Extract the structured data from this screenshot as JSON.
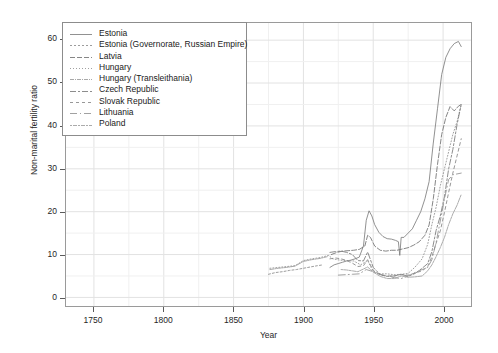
{
  "chart_data": {
    "type": "line",
    "title": "",
    "xlabel": "Year",
    "ylabel": "Non-marital fertility ratio",
    "xlim": [
      1730,
      2020
    ],
    "ylim": [
      -2,
      64
    ],
    "xticks": [
      1750,
      1800,
      1850,
      1900,
      1950,
      2000
    ],
    "yticks": [
      0,
      10,
      20,
      30,
      40,
      50,
      60
    ],
    "grid": true,
    "legend_position": "top-left",
    "series": [
      {
        "name": "Estonia",
        "color": "#7d7d7d",
        "dash": "none",
        "points": [
          [
            1919,
            7.0
          ],
          [
            1922,
            7.6
          ],
          [
            1925,
            7.9
          ],
          [
            1928,
            8.2
          ],
          [
            1931,
            8.5
          ],
          [
            1934,
            8.7
          ],
          [
            1937,
            9.0
          ],
          [
            1940,
            9.4
          ],
          [
            1943,
            12.0
          ],
          [
            1945,
            18.0
          ],
          [
            1947,
            20.2
          ],
          [
            1949,
            19.0
          ],
          [
            1951,
            17.0
          ],
          [
            1954,
            15.2
          ],
          [
            1957,
            14.2
          ],
          [
            1960,
            13.7
          ],
          [
            1963,
            13.6
          ],
          [
            1966,
            13.3
          ],
          [
            1968,
            13.0
          ],
          [
            1969,
            9.8
          ],
          [
            1970,
            14.0
          ],
          [
            1972,
            14.0
          ],
          [
            1975,
            15.0
          ],
          [
            1978,
            16.0
          ],
          [
            1981,
            18.0
          ],
          [
            1984,
            20.0
          ],
          [
            1987,
            23.0
          ],
          [
            1990,
            27.0
          ],
          [
            1993,
            36.0
          ],
          [
            1996,
            44.0
          ],
          [
            1999,
            52.0
          ],
          [
            2002,
            56.0
          ],
          [
            2005,
            58.0
          ],
          [
            2008,
            59.2
          ],
          [
            2011,
            59.7
          ],
          [
            2013,
            58.5
          ]
        ]
      },
      {
        "name": "Estonia (Governorate, Russian Empire)",
        "color": "#8a8a8a",
        "dash": "2,2",
        "points": [
          [
            1875,
            5.4
          ],
          [
            1880,
            5.8
          ],
          [
            1885,
            6.0
          ],
          [
            1890,
            6.3
          ],
          [
            1895,
            6.5
          ],
          [
            1900,
            6.8
          ],
          [
            1905,
            7.1
          ],
          [
            1910,
            7.4
          ],
          [
            1914,
            7.6
          ]
        ]
      },
      {
        "name": "Latvia",
        "color": "#707070",
        "dash": "5,2",
        "points": [
          [
            1920,
            10.0
          ],
          [
            1924,
            10.5
          ],
          [
            1928,
            10.8
          ],
          [
            1932,
            10.9
          ],
          [
            1936,
            11.0
          ],
          [
            1940,
            11.2
          ],
          [
            1944,
            12.0
          ],
          [
            1946,
            14.5
          ],
          [
            1948,
            14.0
          ],
          [
            1951,
            12.0
          ],
          [
            1955,
            11.0
          ],
          [
            1959,
            10.8
          ],
          [
            1963,
            11.0
          ],
          [
            1967,
            11.0
          ],
          [
            1971,
            11.3
          ],
          [
            1975,
            11.6
          ],
          [
            1979,
            12.2
          ],
          [
            1983,
            13.0
          ],
          [
            1987,
            14.5
          ],
          [
            1990,
            16.9
          ],
          [
            1993,
            23.0
          ],
          [
            1996,
            31.0
          ],
          [
            1999,
            38.0
          ],
          [
            2002,
            42.0
          ],
          [
            2005,
            44.5
          ],
          [
            2008,
            43.5
          ],
          [
            2011,
            44.6
          ],
          [
            2013,
            45.0
          ]
        ]
      },
      {
        "name": "Hungary",
        "color": "#8f8f8f",
        "dash": "1,2",
        "points": [
          [
            1876,
            6.8
          ],
          [
            1882,
            7.0
          ],
          [
            1888,
            7.2
          ],
          [
            1894,
            7.4
          ],
          [
            1900,
            8.6
          ],
          [
            1906,
            9.0
          ],
          [
            1912,
            9.3
          ],
          [
            1918,
            9.8
          ],
          [
            1921,
            9.0
          ],
          [
            1926,
            8.7
          ],
          [
            1931,
            8.6
          ],
          [
            1936,
            8.5
          ],
          [
            1941,
            7.6
          ],
          [
            1946,
            8.6
          ],
          [
            1950,
            6.0
          ],
          [
            1955,
            5.5
          ],
          [
            1960,
            5.5
          ],
          [
            1965,
            5.3
          ],
          [
            1970,
            5.4
          ],
          [
            1975,
            5.6
          ],
          [
            1980,
            7.1
          ],
          [
            1985,
            9.0
          ],
          [
            1989,
            12.4
          ],
          [
            1992,
            17.0
          ],
          [
            1995,
            21.0
          ],
          [
            1998,
            26.0
          ],
          [
            2001,
            30.0
          ],
          [
            2004,
            34.0
          ],
          [
            2007,
            38.0
          ],
          [
            2010,
            41.0
          ],
          [
            2013,
            45.0
          ]
        ]
      },
      {
        "name": "Hungary (Transleithania)",
        "color": "#999999",
        "dash": "4,1,1,1",
        "points": [
          [
            1876,
            6.5
          ],
          [
            1882,
            6.8
          ],
          [
            1888,
            7.0
          ],
          [
            1894,
            7.3
          ],
          [
            1900,
            8.4
          ],
          [
            1906,
            8.8
          ],
          [
            1912,
            9.1
          ],
          [
            1917,
            9.5
          ]
        ]
      },
      {
        "name": "Czech Republic",
        "color": "#787878",
        "dash": "6,2,2,2",
        "points": [
          [
            1919,
            10.5
          ],
          [
            1923,
            10.7
          ],
          [
            1927,
            10.8
          ],
          [
            1931,
            10.5
          ],
          [
            1935,
            10.0
          ],
          [
            1939,
            8.6
          ],
          [
            1943,
            8.5
          ],
          [
            1946,
            10.6
          ],
          [
            1950,
            7.0
          ],
          [
            1955,
            5.3
          ],
          [
            1960,
            4.9
          ],
          [
            1965,
            5.0
          ],
          [
            1970,
            5.4
          ],
          [
            1975,
            4.9
          ],
          [
            1980,
            5.6
          ],
          [
            1985,
            6.8
          ],
          [
            1989,
            7.9
          ],
          [
            1992,
            10.7
          ],
          [
            1995,
            15.6
          ],
          [
            1998,
            19.0
          ],
          [
            2001,
            23.5
          ],
          [
            2004,
            30.0
          ],
          [
            2007,
            34.5
          ],
          [
            2010,
            40.3
          ],
          [
            2013,
            45.0
          ]
        ]
      },
      {
        "name": "Slovak Republic",
        "color": "#858585",
        "dash": "3,3",
        "points": [
          [
            1919,
            9.0
          ],
          [
            1923,
            9.2
          ],
          [
            1927,
            9.0
          ],
          [
            1931,
            8.6
          ],
          [
            1935,
            8.0
          ],
          [
            1939,
            7.2
          ],
          [
            1943,
            7.4
          ],
          [
            1946,
            8.8
          ],
          [
            1950,
            6.3
          ],
          [
            1955,
            5.2
          ],
          [
            1960,
            5.0
          ],
          [
            1965,
            5.0
          ],
          [
            1970,
            5.3
          ],
          [
            1975,
            5.2
          ],
          [
            1980,
            5.7
          ],
          [
            1985,
            6.2
          ],
          [
            1989,
            7.2
          ],
          [
            1992,
            9.5
          ],
          [
            1995,
            12.6
          ],
          [
            1998,
            15.5
          ],
          [
            2001,
            19.8
          ],
          [
            2004,
            24.5
          ],
          [
            2007,
            29.0
          ],
          [
            2010,
            33.0
          ],
          [
            2013,
            37.0
          ]
        ]
      },
      {
        "name": "Lithuania",
        "color": "#909090",
        "dash": "7,3,1,3",
        "points": [
          [
            1925,
            5.2
          ],
          [
            1930,
            5.3
          ],
          [
            1935,
            5.4
          ],
          [
            1940,
            5.5
          ],
          [
            1945,
            6.5
          ],
          [
            1950,
            6.0
          ],
          [
            1955,
            5.4
          ],
          [
            1960,
            5.0
          ],
          [
            1965,
            4.6
          ],
          [
            1970,
            4.4
          ],
          [
            1975,
            5.0
          ],
          [
            1980,
            5.8
          ],
          [
            1985,
            6.5
          ],
          [
            1989,
            7.0
          ],
          [
            1992,
            8.8
          ],
          [
            1995,
            12.8
          ],
          [
            1998,
            17.8
          ],
          [
            2001,
            23.0
          ],
          [
            2004,
            27.5
          ],
          [
            2007,
            28.6
          ],
          [
            2010,
            28.8
          ],
          [
            2013,
            29.0
          ]
        ]
      },
      {
        "name": "Poland",
        "color": "#9c9c9c",
        "dash": "2,1,4,1",
        "points": [
          [
            1927,
            6.5
          ],
          [
            1931,
            6.4
          ],
          [
            1935,
            6.2
          ],
          [
            1939,
            6.0
          ],
          [
            1946,
            7.1
          ],
          [
            1950,
            5.9
          ],
          [
            1955,
            4.9
          ],
          [
            1960,
            4.4
          ],
          [
            1965,
            4.4
          ],
          [
            1970,
            5.0
          ],
          [
            1975,
            4.7
          ],
          [
            1980,
            4.8
          ],
          [
            1985,
            5.0
          ],
          [
            1989,
            6.2
          ],
          [
            1992,
            7.6
          ],
          [
            1995,
            9.5
          ],
          [
            1998,
            11.6
          ],
          [
            2001,
            14.0
          ],
          [
            2004,
            17.0
          ],
          [
            2007,
            19.5
          ],
          [
            2010,
            21.5
          ],
          [
            2013,
            24.0
          ]
        ]
      }
    ]
  },
  "legend": {
    "items": [
      {
        "label": "Estonia"
      },
      {
        "label": "Estonia (Governorate, Russian Empire)"
      },
      {
        "label": "Latvia"
      },
      {
        "label": "Hungary"
      },
      {
        "label": "Hungary (Transleithania)"
      },
      {
        "label": "Czech Republic"
      },
      {
        "label": "Slovak Republic"
      },
      {
        "label": "Lithuania"
      },
      {
        "label": "Poland"
      }
    ]
  }
}
